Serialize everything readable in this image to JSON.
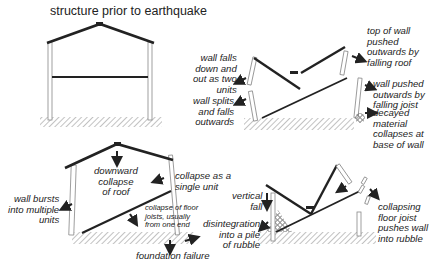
{
  "title": "structure prior to earthquake",
  "panels": {
    "top_right": {
      "wall_falls": "wall falls\ndown and\nout as two\nunits",
      "wall_splits": "wall splits\nand falls\noutwards",
      "top_of_wall": "top of wall\npushed\noutwards by\nfalling roof",
      "wall_pushed": "wall pushed\noutwards by\nfalling joist",
      "decayed": "decayed\nmaterial\ncollapses at\nbase of wall"
    },
    "bottom_left": {
      "downward": "downward\ncollapse\nof roof",
      "single_unit": "collapse as a\nsingle unit",
      "wall_bursts": "wall bursts\ninto multiple\nunits",
      "floor_joists": "collapse of floor\njoists, usually\nfrom one end",
      "foundation": "foundation failure"
    },
    "bottom_right": {
      "vertical_fall": "vertical\nfall",
      "disintegration": "disintegration\ninto a pile\nof rubble",
      "collapsing_joist": "collapsing\nfloor joist\npushes wall\ninto rubble"
    }
  },
  "colors": {
    "line": "#222222",
    "wall": "#888888",
    "hatch": "#777777"
  }
}
